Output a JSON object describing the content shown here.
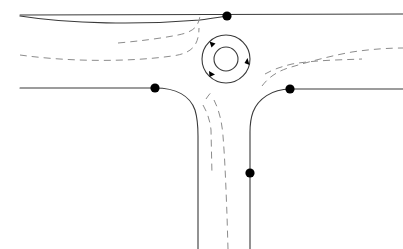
{
  "diagram": {
    "canvas": {
      "width": 403,
      "height": 249,
      "background": "#ffffff"
    },
    "colors": {
      "road_edge": "#3a3a3a",
      "lane_marking": "#8c8c8c",
      "node": "#000000",
      "arrow": "#000000",
      "background": "#ffffff"
    },
    "roundabout": {
      "label": "roundabout",
      "center_x": 226,
      "center_y": 59,
      "outer_radius": 24,
      "inner_radius": 12,
      "direction": "clockwise",
      "arrow_count": 3,
      "arrow_angles_deg": [
        135,
        5,
        230
      ]
    },
    "nodes": [
      {
        "id": "node-north",
        "label": "north-approach-node",
        "x": 227,
        "y": 16
      },
      {
        "id": "node-west",
        "label": "west-approach-node",
        "x": 155,
        "y": 88
      },
      {
        "id": "node-east",
        "label": "east-approach-node",
        "x": 290,
        "y": 89
      },
      {
        "id": "node-south",
        "label": "south-approach-node",
        "x": 250,
        "y": 173
      }
    ],
    "legs": [
      {
        "id": "leg-north-west",
        "label": "north-west-arm"
      },
      {
        "id": "leg-north-east",
        "label": "north-east-arm"
      },
      {
        "id": "leg-west",
        "label": "west-arm"
      },
      {
        "id": "leg-east",
        "label": "east-arm"
      },
      {
        "id": "leg-south",
        "label": "south-arm"
      }
    ],
    "road_edges": [
      {
        "name": "north-edge-upper",
        "d": "M 20 15 L 403 14"
      },
      {
        "name": "north-edge-lower",
        "d": "M 20 16 C 70 24 140 25 200 20 C 212 18.5 220 17 227 16"
      },
      {
        "name": "west-edge-to-south",
        "d": "M 20 88 L 155 88 C 176 88 190 96 195 110 C 198 120 198 128 198 136 L 198 249"
      },
      {
        "name": "east-edge-to-south",
        "d": "M 403 89 L 290 89 C 272 89 258 99 253 112 C 250.5 119 250 126 250 132 L 250 249"
      }
    ],
    "lane_markings": [
      {
        "name": "nw-lane-inner",
        "d": "M 118 43 C 140 41 160 38.5 178 35 C 188 33 194 30 197 25 C 199 21.5 200 18 200 14"
      },
      {
        "name": "nw-lane-outer",
        "d": "M 20 55 C 70 62 130 62 172 56 C 184 54.5 191 51 195 45 C 198 40 199 34 199 28"
      },
      {
        "name": "ne-lane-inner",
        "d": "M 265 74 C 272 70 280 67 292 64 C 316 60 340 60 362 59"
      },
      {
        "name": "ne-lane-outer",
        "d": "M 262 86 C 268 78 276 72 288 68 C 308 62 330 56 352 52 C 372 49 390 48 403 48"
      },
      {
        "name": "south-lane-short",
        "d": "M 203 105 C 207 112 210 120 211 130 L 212 175"
      },
      {
        "name": "south-lane-long",
        "d": "M 214 100 C 219 110 222 122 223 136 C 225 160 226 190 227 215 L 228 249"
      },
      {
        "name": "south-lane-entry",
        "d": "M 206 99 C 208 96 210 93 213 91"
      }
    ]
  }
}
